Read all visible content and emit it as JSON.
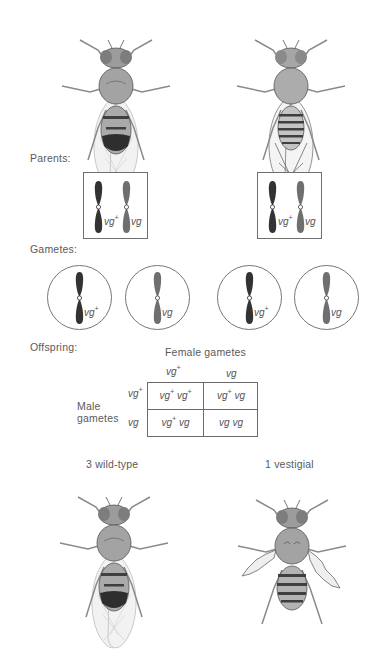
{
  "sections": {
    "parents_label": "Parents:",
    "gametes_label": "Gametes:",
    "offspring_label": "Offspring:"
  },
  "parents": [
    {
      "phenotype": "wild-type",
      "alleles": [
        {
          "symbol": "vg",
          "sup": "+"
        },
        {
          "symbol": "vg",
          "sup": ""
        }
      ]
    },
    {
      "phenotype": "wild-type",
      "alleles": [
        {
          "symbol": "vg",
          "sup": "+"
        },
        {
          "symbol": "vg",
          "sup": ""
        }
      ]
    }
  ],
  "gametes": [
    {
      "symbol": "vg",
      "sup": "+"
    },
    {
      "symbol": "vg",
      "sup": ""
    },
    {
      "symbol": "vg",
      "sup": "+"
    },
    {
      "symbol": "vg",
      "sup": ""
    }
  ],
  "punnett": {
    "column_title": "Female gametes",
    "row_title_line1": "Male",
    "row_title_line2": "gametes",
    "columns": [
      {
        "symbol": "vg",
        "sup": "+"
      },
      {
        "symbol": "vg",
        "sup": ""
      }
    ],
    "rows": [
      {
        "symbol": "vg",
        "sup": "+"
      },
      {
        "symbol": "vg",
        "sup": ""
      }
    ],
    "cells": [
      [
        {
          "a": "vg",
          "asup": "+",
          "b": "vg",
          "bsup": "+"
        },
        {
          "a": "vg",
          "asup": "+",
          "b": "vg",
          "bsup": ""
        }
      ],
      [
        {
          "a": "vg",
          "asup": "+",
          "b": "vg",
          "bsup": ""
        },
        {
          "a": "vg",
          "asup": "",
          "b": "vg",
          "bsup": ""
        }
      ]
    ]
  },
  "offspring": [
    {
      "label": "3 wild-type"
    },
    {
      "label": "1 vestigial"
    }
  ],
  "colors": {
    "dark_chromosome": "#3a3a3a",
    "light_chromosome": "#7a7a7a",
    "body": "#9a9a9a",
    "outline": "#555555"
  }
}
